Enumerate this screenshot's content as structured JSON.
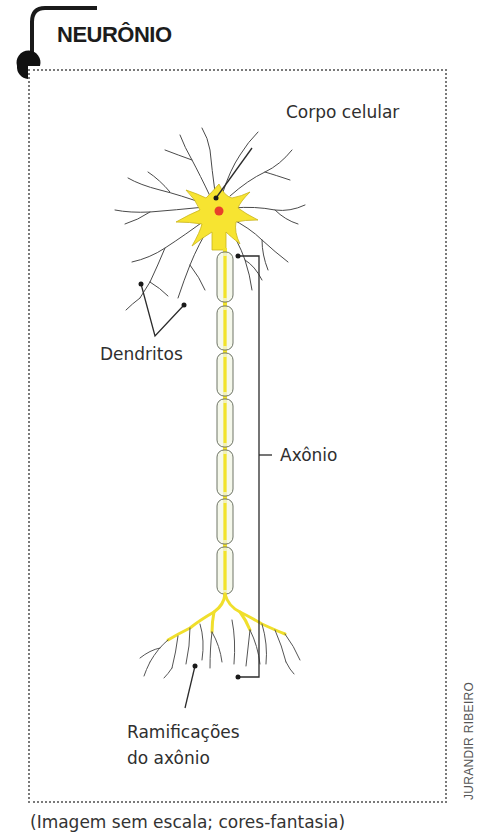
{
  "title": "NEURÔNIO",
  "labels": {
    "cell_body": "Corpo celular",
    "dendrites": "Dendritos",
    "axon": "Axônio",
    "axon_branches_line1": "Ramificações",
    "axon_branches_line2": "do axônio"
  },
  "credit": "JURANDIR RIBEIRO",
  "caption": "(Imagem sem escala; cores-fantasia)",
  "colors": {
    "cell_yellow": "#f7e431",
    "myelin_fill": "#f2f5e4",
    "nucleus_red": "#e8402a",
    "leader_line": "#2b2b2b",
    "frame_dots": "#7a7a7a"
  }
}
